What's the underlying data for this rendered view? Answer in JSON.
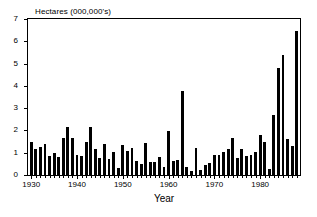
{
  "chart_data": {
    "type": "bar",
    "title": "",
    "ylabel": "Hectares (000,000's)",
    "xlabel": "Year",
    "ylim": [
      0,
      7
    ],
    "yticks": [
      0,
      1,
      2,
      3,
      4,
      5,
      6,
      7
    ],
    "xlim": [
      1929.3,
      1988.7
    ],
    "xticks": [
      1930,
      1940,
      1950,
      1960,
      1970,
      1980
    ],
    "xtick_labels": [
      "1930",
      "1940",
      "1950",
      "1960",
      "1970",
      "1980"
    ],
    "grid": false,
    "legend": null,
    "bar_color": "#000000",
    "categories": [
      "1930",
      "1931",
      "1932",
      "1933",
      "1934",
      "1935",
      "1936",
      "1937",
      "1938",
      "1939",
      "1940",
      "1941",
      "1942",
      "1943",
      "1944",
      "1945",
      "1946",
      "1947",
      "1948",
      "1949",
      "1950",
      "1951",
      "1952",
      "1953",
      "1954",
      "1955",
      "1956",
      "1957",
      "1958",
      "1959",
      "1960",
      "1961",
      "1962",
      "1963",
      "1964",
      "1965",
      "1966",
      "1967",
      "1968",
      "1969",
      "1970",
      "1971",
      "1972",
      "1973",
      "1974",
      "1975",
      "1976",
      "1977",
      "1978",
      "1979",
      "1980",
      "1981",
      "1982",
      "1983",
      "1984",
      "1985",
      "1986",
      "1987",
      "1988"
    ],
    "values": [
      1.5,
      1.15,
      1.25,
      1.4,
      0.85,
      1.0,
      0.8,
      1.65,
      2.15,
      1.67,
      0.9,
      0.85,
      1.5,
      2.15,
      1.15,
      0.78,
      1.38,
      0.72,
      1.05,
      0.3,
      1.35,
      1.1,
      1.2,
      0.62,
      0.5,
      1.43,
      0.58,
      0.6,
      0.83,
      0.38,
      1.98,
      0.63,
      0.68,
      3.75,
      0.38,
      0.2,
      1.2,
      0.22,
      0.45,
      0.55,
      0.88,
      0.9,
      1.02,
      1.15,
      1.67,
      0.78,
      1.18,
      0.85,
      0.88,
      1.03,
      1.8,
      1.47,
      0.28,
      2.7,
      4.78,
      5.37,
      1.62,
      1.28,
      6.45
    ]
  },
  "axis": {
    "y_caption": "Hectares (000,000's)",
    "x_caption": "Year"
  }
}
